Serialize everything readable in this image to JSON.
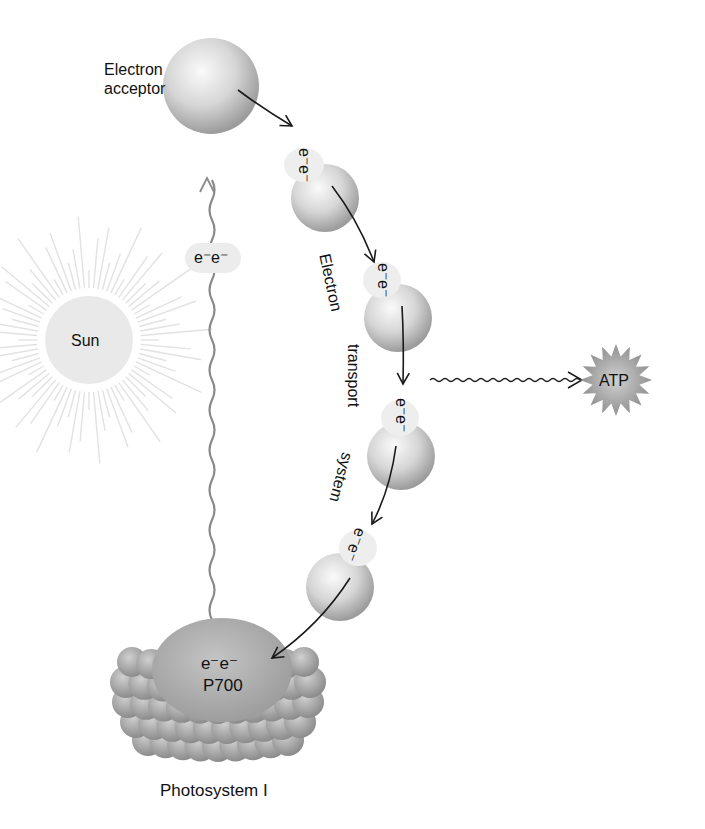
{
  "labels": {
    "electron_acceptor_line1": "Electron",
    "electron_acceptor_line2": "acceptor",
    "sun": "Sun",
    "excited_electrons": "e⁻e⁻",
    "carrier_electrons": "e⁻e⁻",
    "ets_word1": "Electron",
    "ets_word2": "transport",
    "ets_word3": "system",
    "atp": "ATP",
    "p700_electrons": "e⁻e⁻",
    "p700": "P700",
    "photosystem": "Photosystem I"
  },
  "colors": {
    "sphere_light": "#f2f2f2",
    "sphere_dark": "#9a9a9a",
    "sun_fill": "#e8e8e8",
    "sun_rays": "#e4e4e4",
    "wavy_line": "#8a8a8a",
    "arrow": "#1a1a1a",
    "atp_fill": "#9a9a9a",
    "photosystem_bead": "#a8a8a8"
  },
  "carriers": [
    {
      "id": "carrier-1",
      "cx": 325,
      "cy": 198
    },
    {
      "id": "carrier-2",
      "cx": 398,
      "cy": 318
    },
    {
      "id": "carrier-3",
      "cx": 401,
      "cy": 456
    },
    {
      "id": "carrier-4",
      "cx": 340,
      "cy": 587
    }
  ]
}
